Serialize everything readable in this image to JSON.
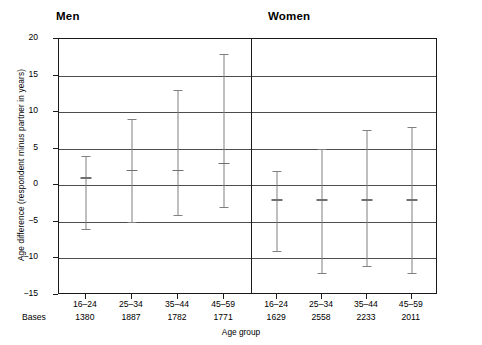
{
  "chart_data": {
    "type": "bar",
    "title": "",
    "xlabel": "Age group",
    "ylabel": "Age difference (respondent minus partner in years)",
    "ylim": [
      -15,
      20
    ],
    "yticks": [
      20,
      15,
      10,
      5,
      0,
      -5,
      -10,
      -15
    ],
    "ytick_labels": [
      "20",
      "15",
      "10",
      "5",
      "0",
      "−5",
      "−10",
      "−15"
    ],
    "grid": true,
    "legend": "none",
    "panels": [
      {
        "name": "Men",
        "categories": [
          "16–24",
          "25–34",
          "35–44",
          "45–59"
        ],
        "bases": [
          "1380",
          "1887",
          "1782",
          "1771"
        ],
        "points": [
          {
            "category": "16–24",
            "upper": 4,
            "median": 1,
            "lower": -6
          },
          {
            "category": "25–34",
            "upper": 9,
            "median": 2,
            "lower": -5
          },
          {
            "category": "35–44",
            "upper": 13,
            "median": 2,
            "lower": -4
          },
          {
            "category": "45–59",
            "upper": 18,
            "median": 3,
            "lower": -3
          }
        ]
      },
      {
        "name": "Women",
        "categories": [
          "16–24",
          "25–34",
          "35–44",
          "45–59"
        ],
        "bases": [
          "1629",
          "2558",
          "2233",
          "2011"
        ],
        "points": [
          {
            "category": "16–24",
            "upper": 2,
            "median": -2,
            "lower": -9
          },
          {
            "category": "25–34",
            "upper": 5,
            "median": -2,
            "lower": -12
          },
          {
            "category": "35–44",
            "upper": 7.5,
            "median": -2,
            "lower": -11
          },
          {
            "category": "45–59",
            "upper": 8,
            "median": -2,
            "lower": -12
          }
        ]
      }
    ],
    "bases_caption": "Bases"
  },
  "colors": {
    "axis": "#1a1a1a",
    "grid": "#4d4d4d",
    "errorbar": "#808080",
    "background": "#ffffff"
  }
}
